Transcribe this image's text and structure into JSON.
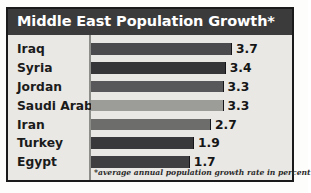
{
  "title": "Middle East Population Growth*",
  "footnote": "*average annual population growth rate in percent",
  "colors": {
    "frame_border": "#1a1a1a",
    "panel_background": "#e9e8e5",
    "title_band": "#3b3b3b",
    "title_text": "#ffffff",
    "label_text": "#1b1b1b",
    "axis_line": "#8d8d8a"
  },
  "chart_data": {
    "type": "bar",
    "orientation": "horizontal",
    "title": "Middle East Population Growth*",
    "xlabel": "",
    "ylabel": "",
    "subtitle": "*average annual population growth rate in percent",
    "units": "percent",
    "grid": false,
    "legend": false,
    "xlim": [
      0,
      3.7
    ],
    "categories": [
      "Iraq",
      "Syria",
      "Jordan",
      "Saudi Arabia",
      "Iran",
      "Turkey",
      "Egypt"
    ],
    "values": [
      3.7,
      3.4,
      3.3,
      3.3,
      2.7,
      1.9,
      1.7
    ],
    "value_labels": [
      "3.7",
      "3.4",
      "3.3",
      "3.3",
      "2.7",
      "1.9",
      "1.7"
    ],
    "bar_colors": [
      "#4b4b4d",
      "#363638",
      "#58585a",
      "#9c9c99",
      "#6d6d6c",
      "#39393b",
      "#3f3f41"
    ],
    "bars": [
      {
        "label": "Iraq",
        "value": 3.7,
        "value_label": "3.7",
        "color": "#4b4b4d"
      },
      {
        "label": "Syria",
        "value": 3.4,
        "value_label": "3.4",
        "color": "#363638"
      },
      {
        "label": "Jordan",
        "value": 3.3,
        "value_label": "3.3",
        "color": "#58585a"
      },
      {
        "label": "Saudi Arabia",
        "value": 3.3,
        "value_label": "3.3",
        "color": "#9c9c99"
      },
      {
        "label": "Iran",
        "value": 2.7,
        "value_label": "2.7",
        "color": "#6d6d6c"
      },
      {
        "label": "Turkey",
        "value": 1.9,
        "value_label": "1.9",
        "color": "#39393b"
      },
      {
        "label": "Egypt",
        "value": 1.7,
        "value_label": "1.7",
        "color": "#3f3f41"
      }
    ]
  }
}
